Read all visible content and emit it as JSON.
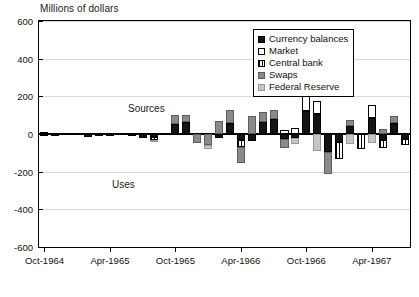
{
  "chart": {
    "title": "Millions of dollars",
    "annotations": [
      {
        "text": "Sources",
        "x": 128,
        "y": 103
      },
      {
        "text": "Uses",
        "x": 112,
        "y": 179
      }
    ]
  },
  "legend": {
    "position": "top-right",
    "items": [
      {
        "label": "Currency balances",
        "swatch": "solid-black",
        "color": "#141414"
      },
      {
        "label": "Market",
        "swatch": "white-outline",
        "color": "#ffffff"
      },
      {
        "label": "Central bank",
        "swatch": "vertical-hatch",
        "color": "#ffffff"
      },
      {
        "label": "Swaps",
        "swatch": "dark-gray",
        "color": "#8a8a8a"
      },
      {
        "label": "Federal Reserve",
        "swatch": "light-gray",
        "color": "#c6c6c6"
      }
    ]
  },
  "chart_data": {
    "type": "bar",
    "stacked": true,
    "orientation": "vertical",
    "title": "Millions of dollars",
    "xlabel": "",
    "ylabel": "Millions of dollars",
    "ylim": [
      -600,
      600
    ],
    "yticks": [
      600,
      400,
      200,
      0,
      -200,
      -400,
      -600
    ],
    "ytick_labels": [
      "600",
      "400",
      "200",
      "0",
      "-200",
      "-400",
      "-600"
    ],
    "grid": true,
    "xtick_labels": [
      "Oct-1964",
      "Apr-1965",
      "Oct-1965",
      "Apr-1966",
      "Oct-1966",
      "Apr-1967"
    ],
    "xtick_indices": [
      0,
      6,
      12,
      18,
      24,
      30
    ],
    "categories": [
      "Oct-1964",
      "Nov-1964",
      "Dec-1964",
      "Jan-1965",
      "Feb-1965",
      "Mar-1965",
      "Apr-1965",
      "May-1965",
      "Jun-1965",
      "Jul-1965",
      "Aug-1965",
      "Sep-1965",
      "Oct-1965",
      "Nov-1965",
      "Dec-1965",
      "Jan-1966",
      "Feb-1966",
      "Mar-1966",
      "Apr-1966",
      "May-1966",
      "Jun-1966",
      "Jul-1966",
      "Aug-1966",
      "Sep-1966",
      "Oct-1966",
      "Nov-1966",
      "Dec-1966",
      "Jan-1967",
      "Feb-1967",
      "Mar-1967",
      "Apr-1967",
      "May-1967",
      "Jun-1967",
      "Jul-1967"
    ],
    "series": [
      {
        "name": "Currency balances",
        "fill": "f-currency",
        "values": [
          -10,
          -12,
          0,
          0,
          -14,
          -10,
          -12,
          0,
          -8,
          -20,
          -14,
          0,
          55,
          62,
          0,
          0,
          -22,
          58,
          -30,
          -36,
          62,
          78,
          -28,
          -20,
          120,
          105,
          -95,
          -40,
          45,
          0,
          85,
          -30,
          60,
          -25
        ]
      },
      {
        "name": "Market",
        "fill": "f-market",
        "values": [
          8,
          6,
          0,
          0,
          0,
          0,
          0,
          0,
          0,
          0,
          0,
          0,
          0,
          0,
          0,
          0,
          0,
          0,
          0,
          0,
          0,
          0,
          22,
          30,
          80,
          68,
          0,
          0,
          0,
          0,
          70,
          0,
          0,
          0
        ]
      },
      {
        "name": "Central bank",
        "fill": "f-central",
        "values": [
          0,
          0,
          0,
          0,
          0,
          0,
          0,
          0,
          0,
          0,
          -18,
          0,
          0,
          0,
          0,
          0,
          0,
          0,
          -40,
          0,
          0,
          0,
          0,
          0,
          0,
          0,
          0,
          -95,
          0,
          -80,
          0,
          -45,
          0,
          -35
        ]
      },
      {
        "name": "Swaps",
        "fill": "f-swaps",
        "values": [
          0,
          0,
          0,
          0,
          0,
          0,
          0,
          0,
          0,
          0,
          0,
          0,
          45,
          38,
          -50,
          -58,
          68,
          72,
          -85,
          95,
          55,
          48,
          -45,
          0,
          95,
          0,
          -120,
          0,
          30,
          0,
          0,
          25,
          35,
          0
        ]
      },
      {
        "name": "Federal Reserve",
        "fill": "f-fed",
        "values": [
          0,
          0,
          0,
          0,
          0,
          0,
          0,
          0,
          0,
          0,
          -12,
          0,
          0,
          0,
          0,
          -20,
          0,
          0,
          0,
          0,
          0,
          0,
          0,
          -35,
          0,
          -90,
          0,
          0,
          -55,
          0,
          -48,
          0,
          0,
          0
        ]
      }
    ]
  }
}
